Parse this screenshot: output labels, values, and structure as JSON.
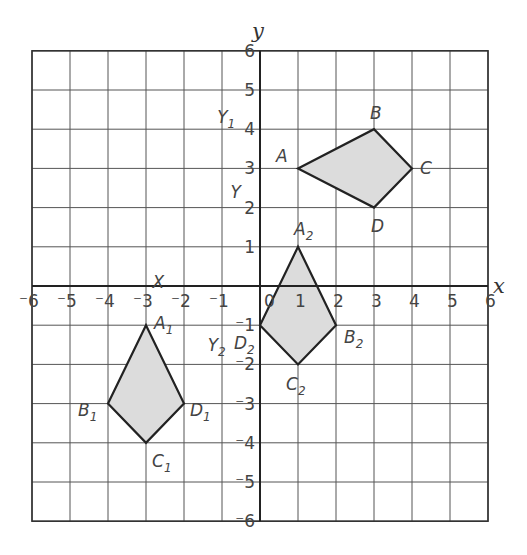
{
  "chart_data": {
    "type": "coordinate-grid",
    "title": "",
    "xlabel": "x",
    "ylabel": "y",
    "xlim": [
      -6,
      6
    ],
    "ylim": [
      -6,
      6
    ],
    "grid": true,
    "x_ticks": [
      "-6",
      "-5",
      "-4",
      "-3",
      "-2",
      "-1",
      "0",
      "1",
      "2",
      "3",
      "4",
      "5",
      "6"
    ],
    "y_ticks": [
      "6",
      "5",
      "4",
      "3",
      "2",
      "1",
      "-1",
      "-2",
      "-3",
      "-4",
      "-5",
      "-6"
    ],
    "shapes": [
      {
        "name": "ABCD",
        "fill": "#dcdcdc",
        "vertices": [
          {
            "label": "A",
            "sub": "",
            "x": 1,
            "y": 3
          },
          {
            "label": "B",
            "sub": "",
            "x": 3,
            "y": 4
          },
          {
            "label": "C",
            "sub": "",
            "x": 4,
            "y": 3
          },
          {
            "label": "D",
            "sub": "",
            "x": 3,
            "y": 2
          }
        ]
      },
      {
        "name": "A1B1C1D1",
        "fill": "#dcdcdc",
        "vertices": [
          {
            "label": "A",
            "sub": "1",
            "x": -3,
            "y": -1
          },
          {
            "label": "B",
            "sub": "1",
            "x": -4,
            "y": -3
          },
          {
            "label": "C",
            "sub": "1",
            "x": -3,
            "y": -4
          },
          {
            "label": "D",
            "sub": "1",
            "x": -2,
            "y": -3
          }
        ]
      },
      {
        "name": "A2B2C2D2",
        "fill": "#dcdcdc",
        "vertices": [
          {
            "label": "A",
            "sub": "2",
            "x": 1,
            "y": 1
          },
          {
            "label": "B",
            "sub": "2",
            "x": 2,
            "y": -1
          },
          {
            "label": "C",
            "sub": "2",
            "x": 1,
            "y": -2
          },
          {
            "label": "D",
            "sub": "2",
            "x": 0,
            "y": -1
          }
        ]
      }
    ],
    "annotations": [
      {
        "text": "Y",
        "sub": "1",
        "x": -0.6,
        "y": 4.3
      },
      {
        "text": "Y",
        "sub": "",
        "x": -0.25,
        "y": 2.4
      },
      {
        "text": "X",
        "sub": "",
        "x": -2.3,
        "y": 0.1
      },
      {
        "text": "Y",
        "sub": "2",
        "x": -0.85,
        "y": -1.5
      }
    ]
  },
  "labels": {
    "x_axis": "x",
    "y_axis": "y"
  }
}
